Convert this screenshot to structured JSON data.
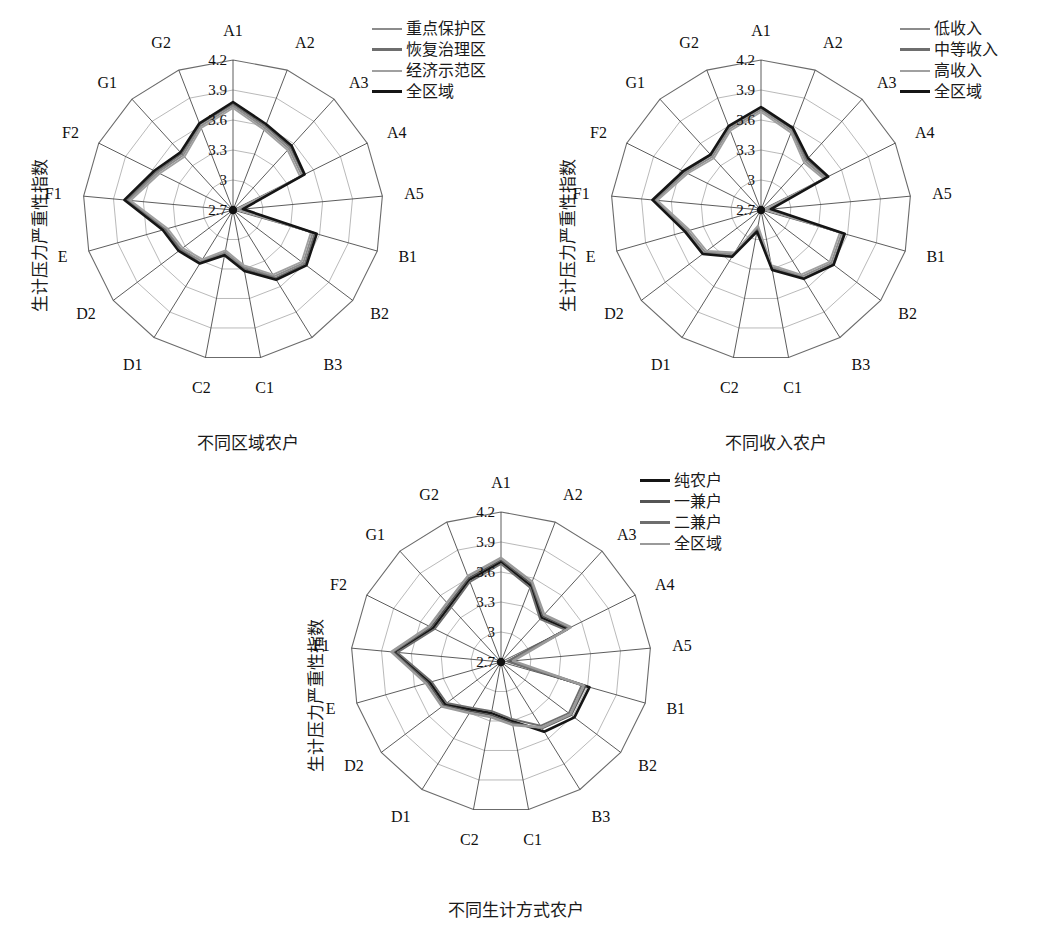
{
  "figure": {
    "axis_categories": [
      "A1",
      "A2",
      "A3",
      "A4",
      "A5",
      "B1",
      "B2",
      "B3",
      "C1",
      "C2",
      "D1",
      "D2",
      "E",
      "F1",
      "F2",
      "G1",
      "G2"
    ],
    "radial_ticks": [
      "2.7",
      "3.0",
      "3.3",
      "3.6",
      "3.9",
      "4.2"
    ],
    "y_axis_title": "生计压力严重性指数"
  },
  "panels": [
    {
      "id": "panel-1",
      "x_axis_title": "不同区域农户",
      "legend": [
        {
          "label": "重点保护区",
          "color": "#8c8c8c",
          "width": 2.0
        },
        {
          "label": "恢复治理区",
          "color": "#6e6e6e",
          "width": 2.2
        },
        {
          "label": "经济示范区",
          "color": "#a0a0a0",
          "width": 2.0
        },
        {
          "label": "全区域",
          "color": "#151515",
          "width": 3.0
        }
      ]
    },
    {
      "id": "panel-2",
      "x_axis_title": "不同收入农户",
      "legend": [
        {
          "label": "低收入",
          "color": "#8c8c8c",
          "width": 2.0
        },
        {
          "label": "中等收入",
          "color": "#6e6e6e",
          "width": 2.2
        },
        {
          "label": "高收入",
          "color": "#a0a0a0",
          "width": 2.0
        },
        {
          "label": "全区域",
          "color": "#151515",
          "width": 3.0
        }
      ]
    },
    {
      "id": "panel-3",
      "x_axis_title": "不同生计方式农户",
      "legend": [
        {
          "label": "纯农户",
          "color": "#151515",
          "width": 3.0
        },
        {
          "label": "一兼户",
          "color": "#555555",
          "width": 2.4
        },
        {
          "label": "二兼户",
          "color": "#6e6e6e",
          "width": 2.2
        },
        {
          "label": "全区域",
          "color": "#9a9a9a",
          "width": 2.0
        }
      ]
    }
  ],
  "chart_data": [
    {
      "type": "radar",
      "title": "不同区域农户",
      "xlabel": "不同区域农户",
      "ylabel": "生计压力严重性指数",
      "categories": [
        "A1",
        "A2",
        "A3",
        "A4",
        "A5",
        "B1",
        "B2",
        "B3",
        "C1",
        "C2",
        "D1",
        "D2",
        "E",
        "F1",
        "F2",
        "G1",
        "G2"
      ],
      "rlim": [
        2.7,
        4.2
      ],
      "rticks": [
        2.7,
        3.0,
        3.3,
        3.6,
        3.9,
        4.2
      ],
      "grid": true,
      "legend_position": "top-right",
      "series": [
        {
          "name": "重点保护区",
          "color": "#8c8c8c",
          "values": [
            3.74,
            3.58,
            3.53,
            3.47,
            2.76,
            3.53,
            3.58,
            3.48,
            3.28,
            3.13,
            3.3,
            3.35,
            3.4,
            3.75,
            3.54,
            3.44,
            3.6
          ]
        },
        {
          "name": "恢复治理区",
          "color": "#6e6e6e",
          "values": [
            3.76,
            3.6,
            3.55,
            3.49,
            2.78,
            3.55,
            3.6,
            3.5,
            3.3,
            3.15,
            3.32,
            3.36,
            3.41,
            3.77,
            3.56,
            3.46,
            3.62
          ]
        },
        {
          "name": "经济示范区",
          "color": "#a0a0a0",
          "values": [
            3.72,
            3.56,
            3.51,
            3.45,
            2.74,
            3.51,
            3.56,
            3.46,
            3.26,
            3.11,
            3.28,
            3.33,
            3.38,
            3.73,
            3.52,
            3.42,
            3.58
          ]
        },
        {
          "name": "全区域",
          "color": "#151515",
          "values": [
            3.78,
            3.62,
            3.57,
            3.5,
            2.8,
            3.57,
            3.62,
            3.52,
            3.32,
            3.16,
            3.33,
            3.38,
            3.43,
            3.79,
            3.58,
            3.48,
            3.63
          ]
        }
      ]
    },
    {
      "type": "radar",
      "title": "不同收入农户",
      "xlabel": "不同收入农户",
      "ylabel": "生计压力严重性指数",
      "categories": [
        "A1",
        "A2",
        "A3",
        "A4",
        "A5",
        "B1",
        "B2",
        "B3",
        "C1",
        "C2",
        "D1",
        "D2",
        "E",
        "F1",
        "F2",
        "G1",
        "G2"
      ],
      "rlim": [
        2.7,
        4.2
      ],
      "rticks": [
        2.7,
        3.0,
        3.3,
        3.6,
        3.9,
        4.2
      ],
      "grid": true,
      "legend_position": "top-right",
      "series": [
        {
          "name": "低收入",
          "color": "#8c8c8c",
          "values": [
            3.7,
            3.55,
            3.36,
            3.42,
            2.76,
            3.54,
            3.58,
            3.48,
            3.28,
            2.88,
            3.22,
            3.4,
            3.46,
            3.76,
            3.54,
            3.42,
            3.57
          ]
        },
        {
          "name": "中等收入",
          "color": "#6e6e6e",
          "values": [
            3.72,
            3.57,
            3.38,
            3.44,
            2.78,
            3.56,
            3.6,
            3.5,
            3.3,
            2.9,
            3.24,
            3.42,
            3.48,
            3.78,
            3.56,
            3.44,
            3.59
          ]
        },
        {
          "name": "高收入",
          "color": "#a0a0a0",
          "values": [
            3.68,
            3.53,
            3.34,
            3.4,
            2.74,
            3.52,
            3.56,
            3.46,
            3.26,
            2.86,
            3.2,
            3.38,
            3.44,
            3.74,
            3.52,
            3.4,
            3.55
          ]
        },
        {
          "name": "全区域",
          "color": "#151515",
          "values": [
            3.73,
            3.58,
            3.4,
            3.45,
            2.8,
            3.57,
            3.61,
            3.51,
            3.31,
            2.92,
            3.25,
            3.43,
            3.49,
            3.79,
            3.57,
            3.45,
            3.6
          ]
        }
      ]
    },
    {
      "type": "radar",
      "title": "不同生计方式农户",
      "xlabel": "不同生计方式农户",
      "ylabel": "生计压力严重性指数",
      "categories": [
        "A1",
        "A2",
        "A3",
        "A4",
        "A5",
        "B1",
        "B2",
        "B3",
        "C1",
        "C2",
        "D1",
        "D2",
        "E",
        "F1",
        "F2",
        "G1",
        "G2"
      ],
      "rlim": [
        2.7,
        4.2
      ],
      "rticks": [
        2.7,
        3.0,
        3.3,
        3.6,
        3.9,
        4.2
      ],
      "grid": true,
      "legend_position": "top-right",
      "series": [
        {
          "name": "纯农户",
          "color": "#151515",
          "values": [
            3.7,
            3.52,
            3.3,
            3.44,
            2.78,
            3.62,
            3.62,
            3.52,
            3.3,
            3.22,
            3.26,
            3.4,
            3.44,
            3.76,
            3.46,
            3.46,
            3.58
          ]
        },
        {
          "name": "一兼户",
          "color": "#555555",
          "values": [
            3.72,
            3.54,
            3.32,
            3.46,
            2.8,
            3.58,
            3.58,
            3.48,
            3.32,
            3.24,
            3.28,
            3.42,
            3.46,
            3.78,
            3.48,
            3.48,
            3.6
          ]
        },
        {
          "name": "二兼户",
          "color": "#6e6e6e",
          "values": [
            3.68,
            3.5,
            3.28,
            3.42,
            2.76,
            3.54,
            3.55,
            3.45,
            3.28,
            3.2,
            3.24,
            3.38,
            3.42,
            3.74,
            3.44,
            3.44,
            3.56
          ]
        },
        {
          "name": "全区域",
          "color": "#9a9a9a",
          "values": [
            3.74,
            3.56,
            3.34,
            3.48,
            2.82,
            3.56,
            3.57,
            3.47,
            3.34,
            3.26,
            3.3,
            3.44,
            3.48,
            3.8,
            3.5,
            3.5,
            3.62
          ]
        }
      ]
    }
  ]
}
